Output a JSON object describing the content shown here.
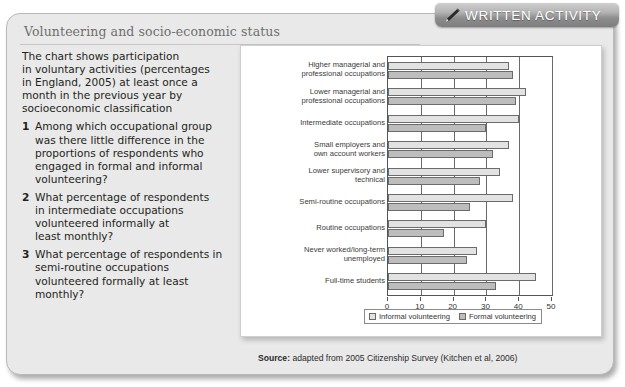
{
  "banner": {
    "label": "WRITTEN ACTIVITY",
    "icon": "pencil-icon"
  },
  "card": {
    "title": "Volunteering and socio-economic status"
  },
  "intro": {
    "lines": [
      "The chart shows participation",
      "in voluntary activities (percentages",
      "in England, 2005) at least once a",
      "month in the previous year by",
      "socioeconomic classification"
    ]
  },
  "questions": [
    {
      "number": "1",
      "lines": [
        "Among which occupational group",
        "was there little difference in the",
        "proportions of respondents who",
        "engaged in formal and informal",
        "volunteering?"
      ]
    },
    {
      "number": "2",
      "lines": [
        "What percentage of respondents",
        "in intermediate occupations",
        "volunteered informally at",
        "least monthly?"
      ]
    },
    {
      "number": "3",
      "lines": [
        "What percentage of respondents in",
        "semi-routine occupations",
        "volunteered formally at least",
        "monthly?"
      ]
    }
  ],
  "chart_data": {
    "type": "bar",
    "orientation": "horizontal",
    "title": "",
    "xlabel": "",
    "ylabel": "",
    "xlim": [
      0,
      50
    ],
    "xticks": [
      0,
      10,
      20,
      30,
      40,
      50
    ],
    "xtick_labels": [
      "0",
      "10",
      "20",
      "30",
      "40",
      "50"
    ],
    "grid": true,
    "legend_position": "bottom",
    "categories": [
      [
        "Higher managerial and",
        "professional occupations"
      ],
      [
        "Lower managerial and",
        "professional occupations"
      ],
      [
        "Intermediate occupations"
      ],
      [
        "Small employers and",
        "own account workers"
      ],
      [
        "Lower supervisory and",
        "technical"
      ],
      [
        "Semi-routine occupations"
      ],
      [
        "Routine occupations"
      ],
      [
        "Never worked/long-term",
        "unemployed"
      ],
      [
        "Full-time students"
      ]
    ],
    "series": [
      {
        "name": "Informal volunteering",
        "color": "#e2e2e2",
        "values": [
          37,
          42,
          40,
          37,
          34,
          38,
          30,
          27,
          45
        ]
      },
      {
        "name": "Formal volunteering",
        "color": "#bdbdbd",
        "values": [
          38,
          39,
          30,
          32,
          28,
          25,
          17,
          24,
          33
        ]
      }
    ]
  },
  "source": {
    "prefix": "Source:",
    "text": " adapted from 2005 Citizenship Survey (Kitchen et al, 2006)",
    "full": "Source: adapted from 2005 Citizenship Survey (Kitchen et al, 2006)"
  }
}
